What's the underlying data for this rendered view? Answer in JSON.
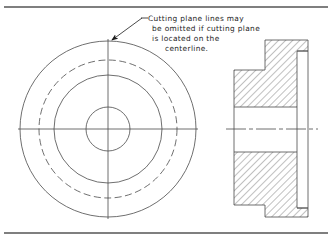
{
  "document": {
    "title": "Sectional View Drawing Plate",
    "type": "engineering-drawing",
    "background_color": "#ffffff",
    "line_color": "#4a4a4a",
    "text_color": "#1c1c1c",
    "border_color": "#555555"
  },
  "annotation": {
    "name": "cutting-plane-note",
    "lines": [
      "Cutting plane lines may",
      "be omitted if cutting plane",
      "is located on the",
      "centerline."
    ],
    "full_text": "Cutting plane lines may be omitted if cutting plane is located on the centerline.",
    "leader": {
      "text_anchor_x": 142,
      "text_anchor_y": 18,
      "arrow_x": 110,
      "arrow_y": 41
    }
  },
  "front_view": {
    "name": "circular-front-view",
    "center_x": 108,
    "center_y": 129,
    "circles": [
      {
        "name": "outer-diameter",
        "radius": 88,
        "style": "solid"
      },
      {
        "name": "bolt-circle",
        "radius": 69,
        "style": "dashed"
      },
      {
        "name": "hub-diameter",
        "radius": 54,
        "style": "solid"
      },
      {
        "name": "bore-diameter",
        "radius": 22,
        "style": "solid"
      }
    ],
    "centerlines": {
      "horizontal": {
        "x1": 18,
        "x2": 198,
        "y": 129
      },
      "vertical": {
        "x": 108,
        "y1": 39,
        "y2": 219
      }
    }
  },
  "section_view": {
    "name": "sectional-side-view",
    "left_edge": 234,
    "right_edge": 308,
    "flange_top": 70,
    "flange_bottom": 205,
    "hub_left": 265,
    "hub_top": 40,
    "hub_bottom": 217,
    "step_x": 297,
    "step_top": 51,
    "step_bottom": 208,
    "bore_top": 107,
    "bore_bottom": 152,
    "centerline": {
      "x1": 226,
      "x2": 318,
      "y": 129
    },
    "hatch": {
      "name": "section-hatching",
      "angle_degrees": 45,
      "spacing_px": 5
    }
  },
  "borders": {
    "top_rule_y": 7,
    "bottom_rule_y": 233
  }
}
